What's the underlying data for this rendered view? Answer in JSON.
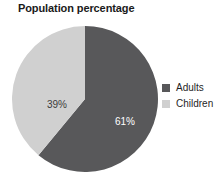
{
  "chart_data": {
    "type": "pie",
    "title": "Population percentage",
    "categories": [
      "Adults",
      "Children"
    ],
    "values": [
      61,
      39
    ],
    "value_labels": [
      "61%",
      "39%"
    ],
    "units": "percent",
    "total": 100,
    "colors": [
      "#58585a",
      "#d0d0d0"
    ],
    "label_text_colors": [
      "#ffffff",
      "#3b3b3b"
    ],
    "start_angle_deg": 0,
    "direction": "clockwise",
    "legend": {
      "position": "right",
      "entries": [
        {
          "label": "Adults",
          "color": "#58585a",
          "value_label": "61%"
        },
        {
          "label": "Children",
          "color": "#d0d0d0",
          "value_label": "39%"
        }
      ]
    },
    "grid": false,
    "xlabel": "",
    "ylabel": ""
  },
  "background_color": "#ffffff"
}
